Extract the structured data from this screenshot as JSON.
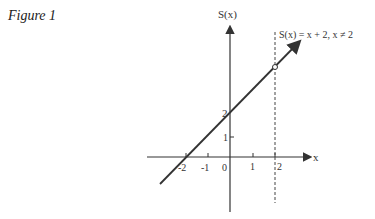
{
  "figure": {
    "title": "Figure 1",
    "y_axis_label": "S(x)",
    "x_axis_label": "x",
    "function_label": "S(x) = x + 2, x ≠ 2",
    "x_ticks": [
      "-2",
      "-1",
      "0",
      "1",
      "2"
    ],
    "y_ticks": [
      "1",
      "2"
    ],
    "hole_point": {
      "x": 2,
      "y": 4
    },
    "asymptote_line": "x = 2 (dashed)"
  }
}
